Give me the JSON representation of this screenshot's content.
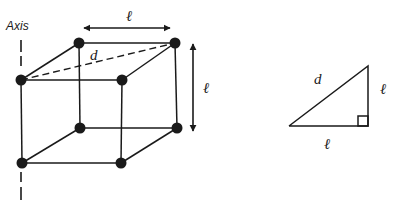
{
  "figure": {
    "cube": {
      "axis_label": "Axis",
      "top_edge_label": "ℓ",
      "side_edge_label": "ℓ",
      "diagonal_label": "d"
    },
    "triangle": {
      "hypotenuse_label": "d",
      "vertical_leg_label": "ℓ",
      "horizontal_leg_label": "ℓ"
    },
    "colors": {
      "ink": "#1a1a1a",
      "background": "#ffffff"
    }
  }
}
